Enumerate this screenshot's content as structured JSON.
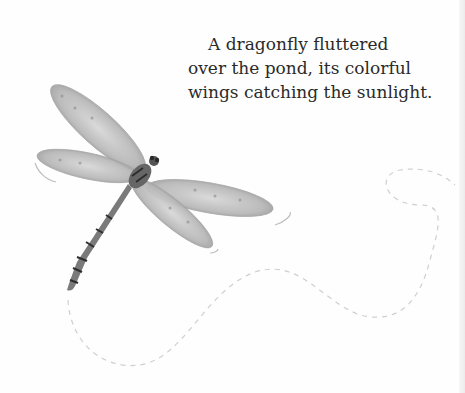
{
  "caption": {
    "lines": [
      "A dragonfly fluttered",
      "over the pond, its colorful",
      "wings catching the sunlight."
    ]
  },
  "illustration": {
    "subject": "dragonfly-icon",
    "path": "dashed-flight-path",
    "palette": {
      "wing": "#b9b9b9",
      "wing_shadow": "#8f8f8f",
      "body": "#6a6a6a",
      "stripe": "#2e2e2e",
      "path": "#c8c8c8"
    }
  }
}
